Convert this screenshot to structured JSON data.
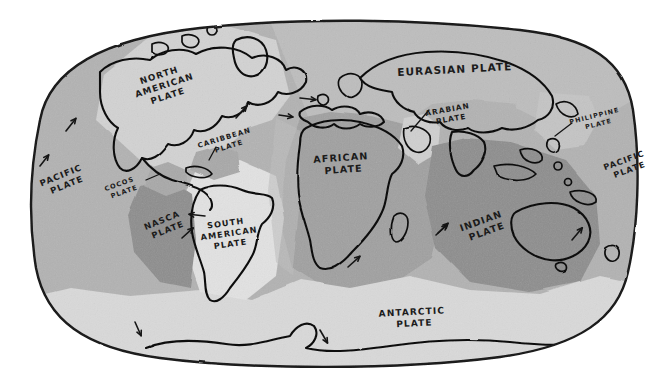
{
  "map": {
    "title": "Tectonic Plates World Map",
    "style": "hand-drawn sketch",
    "background_color": "#ffffff",
    "outline_color": "#1a1a1a",
    "coastline_color": "#111111",
    "projection_shape": "rounded-rectangle-oval"
  },
  "palette": {
    "pacific_gray": "#b2b2b2",
    "north_american_light": "#d2d2d2",
    "eurasian_gray": "#bdbdbd",
    "african_mid": "#a0a0a0",
    "indian_dark": "#8d8d8d",
    "nasca_dark": "#8d8d8d",
    "antarctic_light": "#d9d9d9",
    "south_american_light": "#e2e2e2",
    "arabian_light": "#cfcfcf",
    "philippine_light": "#c4c4c4",
    "caribbean_mid": "#a8a8a8",
    "cocos_mid": "#a8a8a8"
  },
  "plates": [
    {
      "id": "pacific-west",
      "name": "PACIFIC\nPLATE",
      "line1": "PACIFIC",
      "line2": "PLATE",
      "x": 62,
      "y": 178,
      "rotate": -22,
      "size": 8.6,
      "color": "#b2b2b2"
    },
    {
      "id": "pacific-east",
      "name": "PACIFIC\nPLATE",
      "line1": "PACIFIC",
      "line2": "PLATE",
      "x": 625,
      "y": 163,
      "rotate": -20,
      "size": 8.2,
      "color": "#b2b2b2"
    },
    {
      "id": "north-american",
      "name": "NORTH\nAMERICAN\nPLATE",
      "line1": "NORTH",
      "line2": "AMERICAN",
      "line3": "PLATE",
      "x": 160,
      "y": 78,
      "rotate": -18,
      "size": 8.8,
      "color": "#d2d2d2"
    },
    {
      "id": "eurasian",
      "name": "EURASIAN PLATE",
      "line1": "EURASIAN  PLATE",
      "x": 455,
      "y": 73,
      "rotate": -3,
      "size": 10.5,
      "color": "#bdbdbd"
    },
    {
      "id": "african",
      "name": "AFRICAN\nPLATE",
      "line1": "AFRICAN",
      "line2": "PLATE",
      "x": 341,
      "y": 161,
      "rotate": -4,
      "size": 9.6,
      "color": "#a0a0a0"
    },
    {
      "id": "indian",
      "name": "INDIAN\nPLATE",
      "line1": "INDIAN",
      "line2": "PLATE",
      "x": 482,
      "y": 224,
      "rotate": -20,
      "size": 9.4,
      "color": "#8d8d8d"
    },
    {
      "id": "antarctic",
      "name": "ANTARCTIC\nPLATE",
      "line1": "ANTARCTIC",
      "line2": "PLATE",
      "x": 412,
      "y": 315,
      "rotate": -3,
      "size": 9.0,
      "color": "#d9d9d9"
    },
    {
      "id": "south-american",
      "name": "SOUTH\nAMERICAN\nPLATE",
      "line1": "SOUTH",
      "line2": "AMERICAN",
      "line3": "PLATE",
      "x": 226,
      "y": 226,
      "rotate": -8,
      "size": 8.2,
      "color": "#e2e2e2"
    },
    {
      "id": "nasca",
      "name": "NASCA\nPLATE",
      "line1": "NASCA",
      "line2": "PLATE",
      "x": 163,
      "y": 223,
      "rotate": -22,
      "size": 8.4,
      "color": "#8d8d8d"
    },
    {
      "id": "cocos",
      "name": "COCOS\nPLATE",
      "line1": "COCOS",
      "line2": "PLATE",
      "x": 120,
      "y": 186,
      "rotate": -20,
      "size": 6.6,
      "color": "#a8a8a8"
    },
    {
      "id": "caribbean",
      "name": "CARIBBEAN\nPLATE",
      "line1": "CARIBBEAN",
      "line2": "PLATE",
      "x": 225,
      "y": 140,
      "rotate": -17,
      "size": 7.0,
      "color": "#a8a8a8"
    },
    {
      "id": "arabian",
      "name": "ARABIAN\nPLATE",
      "line1": "ARABIAN",
      "line2": "PLATE",
      "x": 448,
      "y": 112,
      "rotate": -10,
      "size": 7.4,
      "color": "#cfcfcf"
    },
    {
      "id": "philippine",
      "name": "PHILIPPINE\nPLATE",
      "line1": "PHILIPPINE",
      "line2": "PLATE",
      "x": 595,
      "y": 118,
      "rotate": -14,
      "size": 6.4,
      "color": "#c4c4c4"
    }
  ],
  "leader_lines": [
    {
      "id": "cocos-leader",
      "from_label": "COCOS PLATE",
      "x1": 146,
      "y1": 180,
      "x2": 160,
      "y2": 174
    },
    {
      "id": "caribbean-leader",
      "from_label": "CARIBBEAN PLATE",
      "x1": 216,
      "y1": 147,
      "x2": 209,
      "y2": 160
    },
    {
      "id": "arabian-leader",
      "from_label": "ARABIAN PLATE",
      "x1": 429,
      "y1": 110,
      "x2": 411,
      "y2": 131
    },
    {
      "id": "philippine-leader",
      "from_label": "PHILIPPINE PLATE",
      "x1": 572,
      "y1": 123,
      "x2": 555,
      "y2": 136
    }
  ],
  "motion_arrows": [
    {
      "id": "arrow-pacific-nw-1",
      "x": 66,
      "y": 131,
      "angle": -52,
      "len": 16,
      "description": "Pacific plate northwest motion"
    },
    {
      "id": "arrow-pacific-nw-2",
      "x": 40,
      "y": 166,
      "angle": -52,
      "len": 14,
      "description": "Pacific plate northwest motion"
    },
    {
      "id": "arrow-nasca-ne",
      "x": 182,
      "y": 238,
      "angle": -42,
      "len": 15,
      "description": "Nasca plate northeast motion"
    },
    {
      "id": "arrow-caribbean-ne",
      "x": 236,
      "y": 118,
      "angle": -48,
      "len": 16,
      "description": "Caribbean-North America motion"
    },
    {
      "id": "arrow-atlantic-e-1",
      "x": 300,
      "y": 98,
      "angle": 6,
      "len": 16,
      "description": "Mid-Atlantic spreading east"
    },
    {
      "id": "arrow-atlantic-e-2",
      "x": 279,
      "y": 115,
      "angle": 8,
      "len": 14,
      "description": "Eurasia-Africa convergence"
    },
    {
      "id": "arrow-samerica-w",
      "x": 205,
      "y": 216,
      "angle": 186,
      "len": 16,
      "description": "South American plate west motion"
    },
    {
      "id": "arrow-africa-ne",
      "x": 348,
      "y": 267,
      "angle": -42,
      "len": 16,
      "description": "African plate northeast motion"
    },
    {
      "id": "arrow-africa-ne-2",
      "x": 436,
      "y": 235,
      "angle": -42,
      "len": 15,
      "description": "African-Indian boundary motion"
    },
    {
      "id": "arrow-indian-ne",
      "x": 438,
      "y": 233,
      "angle": -44,
      "len": 14,
      "description": "Indian plate northeast motion"
    },
    {
      "id": "arrow-australia-ne",
      "x": 572,
      "y": 240,
      "angle": -50,
      "len": 16,
      "description": "Australia northeast motion"
    },
    {
      "id": "arrow-antarctic-s1",
      "x": 135,
      "y": 322,
      "angle": 66,
      "len": 15,
      "description": "Antarctic plate south motion"
    },
    {
      "id": "arrow-antarctic-s2",
      "x": 320,
      "y": 330,
      "angle": 60,
      "len": 15,
      "description": "Antarctic plate south motion"
    }
  ]
}
